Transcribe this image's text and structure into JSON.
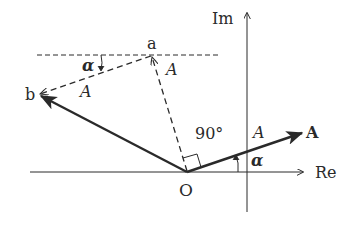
{
  "diagram": {
    "type": "phasor-diagram",
    "axes": {
      "real_label": "Re",
      "imag_label": "Im"
    },
    "points": {
      "origin": "O",
      "a": "a",
      "b": "b"
    },
    "phasor": {
      "label": "A",
      "magnitude_label": "A",
      "angle_label": "α"
    },
    "dashed_segments": {
      "Oa_magnitude": "A",
      "ab_magnitude": "A",
      "ab_angle": "α"
    },
    "right_angle_label": "90°",
    "colors": {
      "line": "#2a2a2a",
      "background": "#ffffff"
    }
  }
}
